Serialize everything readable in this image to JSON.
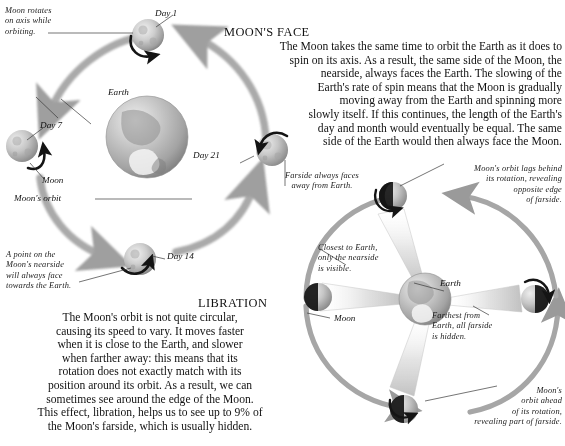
{
  "figure": {
    "background_color": "#ffffff",
    "ink_color": "#1a1a1a",
    "arrow_color": "#9a9a9a",
    "moon_light": "#d8d8d8",
    "moon_dark": "#1c1c1c",
    "earth_color": "#b8b8b8"
  },
  "orbit_diagram": {
    "title_note": "Moon orbit and rotation diagram",
    "annotations": {
      "rotation_note": "Moon rotates\non axis while\norbiting.",
      "nearside_note": "A point on the\nMoon's nearside\nwill always face\ntowards the Earth.",
      "farside_note": "Farside always faces\naway from Earth."
    },
    "labels": {
      "day1": "Day 1",
      "day7": "Day 7",
      "day14": "Day 14",
      "day21": "Day 21",
      "earth": "Earth",
      "moon": "Moon",
      "moons_orbit": "Moon's orbit"
    }
  },
  "moons_face": {
    "heading": "MOON'S FACE",
    "lines": [
      "The Moon takes the same time to orbit the Earth as it does to",
      "spin on its axis. As a result, the same side of the Moon, the",
      "nearside, always faces the Earth. The slowing of the",
      "Earth's rate of spin means that the Moon is gradually",
      "moving away from the Earth and spinning more",
      "slowly itself. If this continues, the length of the Earth's",
      "day and month would eventually be equal. The same",
      "side of the Earth would then always face the Moon."
    ]
  },
  "libration": {
    "heading": "LIBRATION",
    "lines": [
      "The Moon's orbit is not quite circular,",
      "causing its speed to vary. It moves faster",
      "when it is close to the Earth, and slower",
      "when farther away: this means that its",
      "rotation does not exactly match with its",
      "position around its orbit. As a result, we can",
      "sometimes see around the edge of the Moon.",
      "This effect, libration, helps us to see up to 9% of",
      "the Moon's farside, which is usually hidden."
    ],
    "labels": {
      "earth": "Earth",
      "moon": "Moon"
    },
    "annotations": {
      "lags_behind": "Moon's orbit lags behind\nits rotation, revealing\nopposite edge\nof farside.",
      "closest": "Closest to Earth,\nonly the nearside\nis visible.",
      "farthest": "Farthest from\nEarth, all farside\nis hidden.",
      "ahead": "Moon's\norbit ahead\nof its rotation,\nrevealing part of farside."
    }
  }
}
